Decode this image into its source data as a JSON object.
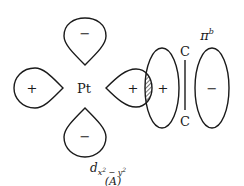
{
  "diagram": {
    "center_atom": "Pt",
    "lobes": [
      {
        "position": "top",
        "sign": "−"
      },
      {
        "position": "left",
        "sign": "+"
      },
      {
        "position": "right",
        "sign": "+"
      },
      {
        "position": "bottom",
        "sign": "−"
      }
    ],
    "pi_orbital": {
      "label_base": "π",
      "label_sup": "b",
      "left_lobe_sign": "+",
      "right_lobe_sign": "−"
    },
    "carbon_top": "C",
    "carbon_bottom": "C",
    "orbital_label": {
      "base": "d",
      "subscript": "x",
      "sup1": "2",
      "minus": " − ",
      "sub2": "y",
      "sup2": "2"
    },
    "figure_label": "(A)",
    "colors": {
      "line": "#1a1a1a",
      "background": "#ffffff"
    }
  }
}
